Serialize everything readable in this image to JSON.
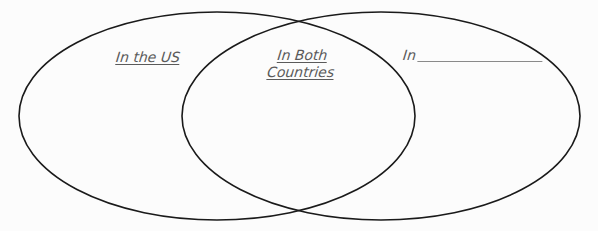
{
  "diagram": {
    "type": "venn",
    "sets": [
      {
        "id": "left",
        "label": "In the US",
        "shape": {
          "cx": 217,
          "cy": 116,
          "rx": 198,
          "ry": 104
        }
      },
      {
        "id": "right",
        "label_prefix": "In",
        "label_blank": "",
        "shape": {
          "cx": 381,
          "cy": 116,
          "rx": 199,
          "ry": 104
        }
      }
    ],
    "intersection": {
      "label_line1": "In Both",
      "label_line2": "Countries"
    },
    "colors": {
      "stroke": "#1a1a1a",
      "label_text": "#5a5a5a",
      "background": "#fcfcfc"
    }
  }
}
